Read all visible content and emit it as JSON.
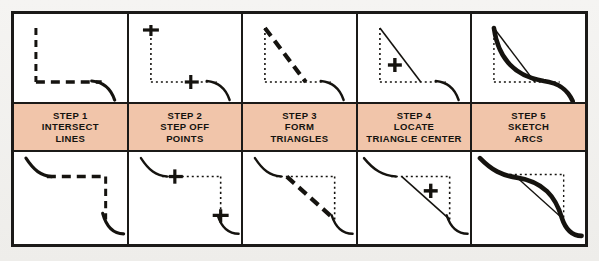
{
  "figure": {
    "title_present": false,
    "columns": 5,
    "rows": 2,
    "colors": {
      "page_background": "#f2f1ef",
      "panel_background": "#ffffff",
      "frame_border": "#1b1a18",
      "label_band": "#f1c5aa",
      "ink": "#15130f"
    }
  },
  "steps": [
    {
      "number": "STEP 1",
      "line1": "INTERSECT",
      "line2": "LINES",
      "top_drawing": "two-dashed-lines-meeting-at-corner-with-solid-curve",
      "bottom_drawing": "mirrored-two-dashed-lines-meeting-at-corner-with-solid-curve"
    },
    {
      "number": "STEP 2",
      "line1": "STEP OFF",
      "line2": "POINTS",
      "top_drawing": "dotted-corner-with-tick-marks-on-each-leg",
      "bottom_drawing": "mirrored-dotted-corner-with-tick-marks-on-each-leg"
    },
    {
      "number": "STEP 3",
      "line1": "FORM",
      "line2": "TRIANGLES",
      "top_drawing": "dotted-corner-with-bold-dashed-hypotenuse",
      "bottom_drawing": "mirrored-dotted-corner-with-bold-dashed-hypotenuse"
    },
    {
      "number": "STEP 4",
      "line1": "LOCATE",
      "line2": "TRIANGLE CENTER",
      "top_drawing": "triangle-with-plus-center-mark",
      "bottom_drawing": "mirrored-triangle-with-plus-center-mark"
    },
    {
      "number": "STEP 5",
      "line1": "SKETCH",
      "line2": "ARCS",
      "top_drawing": "triangle-construction-with-bold-sketched-arc",
      "bottom_drawing": "mirrored-triangle-construction-with-bold-sketched-arc"
    }
  ]
}
